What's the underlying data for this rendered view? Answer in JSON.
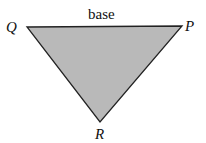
{
  "diagram": {
    "type": "triangle",
    "fill_color": "#b9b9b9",
    "stroke_color": "#222222",
    "vertices": {
      "Q": {
        "label": "Q",
        "x": 27,
        "y": 27
      },
      "P": {
        "label": "P",
        "x": 182,
        "y": 26
      },
      "R": {
        "label": "R",
        "x": 100,
        "y": 122
      }
    },
    "side_label": "base"
  }
}
